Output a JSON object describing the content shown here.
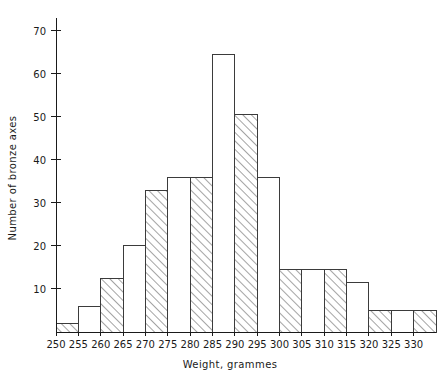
{
  "chart_data": {
    "type": "bar",
    "title": "",
    "subtitle": "",
    "xlabel": "Weight,  grammes",
    "ylabel": "Number of bronze axes",
    "categories": [
      "250-255",
      "255-260",
      "260-265",
      "265-270",
      "270-275",
      "275-280",
      "280-285",
      "285-290",
      "290-295",
      "295-300",
      "300-305",
      "305-310",
      "310-315",
      "315-320",
      "320-325",
      "325-330",
      "330-335"
    ],
    "bin_starts": [
      250,
      255,
      260,
      265,
      270,
      275,
      280,
      285,
      290,
      295,
      300,
      305,
      310,
      315,
      320,
      325,
      330
    ],
    "bin_width": 5,
    "values": [
      2,
      6,
      12.5,
      20,
      33,
      36,
      36,
      64.5,
      50.5,
      36,
      14.5,
      14.5,
      14.5,
      11.5,
      5,
      5,
      5
    ],
    "fills": [
      "hatch",
      "plain",
      "hatch",
      "plain",
      "hatch",
      "plain",
      "hatch",
      "plain",
      "hatch",
      "plain",
      "hatch",
      "plain",
      "hatch",
      "plain",
      "hatch",
      "plain",
      "hatch"
    ],
    "xlim": [
      250,
      335
    ],
    "ylim": [
      0,
      73
    ],
    "xticks": [
      250,
      255,
      260,
      265,
      270,
      275,
      280,
      285,
      290,
      295,
      300,
      305,
      310,
      315,
      320,
      325,
      330
    ],
    "xtick_labels": [
      "250",
      "255",
      "260",
      "265",
      "270",
      "275",
      "280",
      "285",
      "290",
      "295",
      "300",
      "305",
      "310",
      "315",
      "320",
      "325",
      "330"
    ],
    "yticks": [
      10,
      20,
      30,
      40,
      50,
      60,
      70
    ],
    "ytick_labels": [
      "10",
      "20",
      "30",
      "40",
      "50",
      "60",
      "70"
    ],
    "grid": false,
    "legend": null,
    "legend_position": "none",
    "colors": {
      "axis": "#1a1a1a",
      "bar_outline": "#3b3b3b",
      "bar_plain_fill": "#ffffff",
      "hatch_stroke": "#4a4a4a",
      "background": "#ffffff"
    }
  }
}
